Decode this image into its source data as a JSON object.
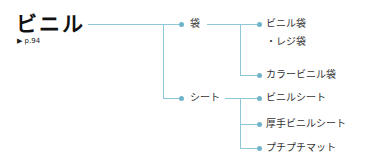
{
  "root": {
    "title": "ビニル",
    "page_ref": "▶ p.94"
  },
  "branches": [
    {
      "label": "袋",
      "children": [
        {
          "label": "ビニル袋",
          "note": "・レジ袋"
        },
        {
          "label": "カラービニル袋"
        }
      ]
    },
    {
      "label": "シート",
      "children": [
        {
          "label": "ビニルシート"
        },
        {
          "label": "厚手ビニルシート"
        },
        {
          "label": "プチプチマット"
        }
      ]
    }
  ],
  "colors": {
    "line": "#8ec8d8",
    "dot": "#6fb4c8"
  }
}
